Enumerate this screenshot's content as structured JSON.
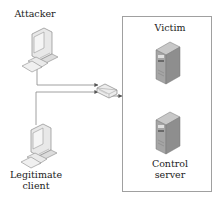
{
  "diagram": {
    "nodes": {
      "attacker": {
        "label": "Attacker",
        "icon": "desktop-computer-icon"
      },
      "client": {
        "label": "Legitimate\nclient",
        "label_lines": [
          "Legitimate",
          "client"
        ],
        "icon": "desktop-computer-icon"
      },
      "router": {
        "label": "",
        "icon": "router-icon"
      },
      "victim": {
        "label": "Victim",
        "icon": "server-tower-icon"
      },
      "control": {
        "label": "Control\nserver",
        "label_lines": [
          "Control",
          "server"
        ],
        "icon": "server-tower-icon"
      }
    },
    "group": {
      "name": "target-network",
      "members": [
        "victim",
        "control"
      ]
    },
    "edges": [
      {
        "from": "attacker",
        "to": "router",
        "arrow": true
      },
      {
        "from": "client",
        "to": "router",
        "arrow": true
      },
      {
        "from": "router",
        "to": "target-network",
        "arrow": true
      }
    ],
    "colors": {
      "line": "#7a7a7a",
      "box_border": "#9a9a9a",
      "server_body": "#9a9a9a",
      "server_dark": "#6e6e6e"
    }
  }
}
